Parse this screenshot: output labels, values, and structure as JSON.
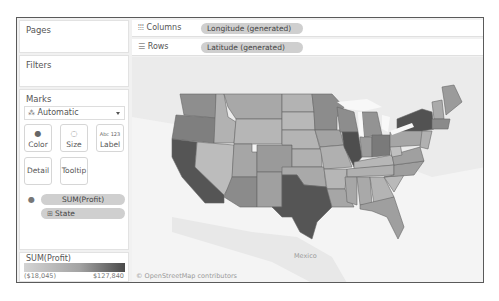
{
  "left_panel": {
    "pages": {
      "title": "Pages"
    },
    "filters": {
      "title": "Filters"
    },
    "marks": {
      "title": "Marks",
      "mark_type": "Automatic",
      "buttons": [
        {
          "label": "Color",
          "icon": "color-icon"
        },
        {
          "label": "Size",
          "icon": "size-icon"
        },
        {
          "label": "Label",
          "icon": "label-icon",
          "icon_text": "Abc 123"
        },
        {
          "label": "Detail",
          "icon": ""
        },
        {
          "label": "Tooltip",
          "icon": ""
        }
      ],
      "fields": [
        {
          "label": "SUM(Profit)",
          "icon": "color-icon"
        },
        {
          "label": "State",
          "icon": "plus-icon"
        }
      ]
    },
    "legend": {
      "title": "SUM(Profit)",
      "min_label": "($18,045)",
      "max_label": "$127,840",
      "colors": [
        "#d4d4d4",
        "#a3a3a3",
        "#4a4a4a"
      ]
    }
  },
  "shelves": {
    "columns": {
      "label": "Columns",
      "pill": "Longitude (generated)",
      "icon": "columns-icon"
    },
    "rows": {
      "label": "Rows",
      "pill": "Latitude (generated)",
      "icon": "rows-icon"
    }
  },
  "map": {
    "label_mexico": "Mexico",
    "attribution": "© OpenStreetMap contributors",
    "state_shades": {
      "darkest": "#4d4d4d",
      "dark": "#7a7a7a",
      "medium": "#9a9a9a",
      "light": "#b3b3b3",
      "lightest": "#c6c6c6"
    }
  }
}
